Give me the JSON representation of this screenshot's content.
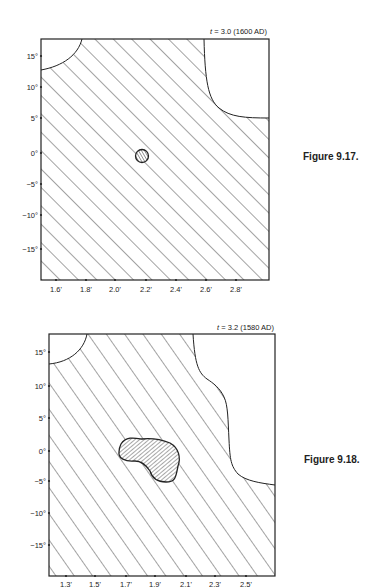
{
  "figures": [
    {
      "caption": "Figure 9.17.",
      "time_label_t": "t",
      "time_label": " = 3.0 (1600 AD)",
      "y_ticks": [
        "15°",
        "10°",
        "5°",
        "0°",
        "−5°",
        "−10°",
        "−15°"
      ],
      "x_ticks": [
        "1.6'",
        "1.8'",
        "2.0'",
        "2.2'",
        "2.4'",
        "2.6'",
        "2.8'"
      ]
    },
    {
      "caption": "Figure 9.18.",
      "time_label_t": "t",
      "time_label": " = 3.2 (1580 AD)",
      "y_ticks": [
        "15°",
        "10°",
        "5°",
        "0°",
        "−5°",
        "−10°",
        "−15°"
      ],
      "x_ticks": [
        "1.3'",
        "1.5'",
        "1.7'",
        "1.9'",
        "2.1'",
        "2.3'",
        "2.5'"
      ]
    }
  ],
  "colors": {
    "ink": "#222222",
    "background": "#ffffff"
  }
}
